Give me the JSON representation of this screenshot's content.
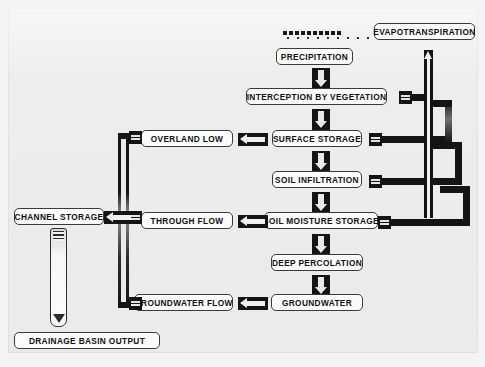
{
  "diagram": {
    "background_color": "#ededed",
    "box_fill": "#fbfbfb",
    "line_color": "#141414",
    "nodes": {
      "precipitation": "PRECIPITATION",
      "interception": "INTERCEPTION BY VEGETATION",
      "surface_storage": "SURFACE STORAGE",
      "soil_infiltration": "SOIL INFILTRATION",
      "soil_moisture_storage": "SOIL MOISTURE STORAGE",
      "deep_percolation": "DEEP PERCOLATION",
      "groundwater": "GROUNDWATER",
      "overland_flow": "OVERLAND LOW",
      "through_flow": "THROUGH FLOW",
      "groundwater_flow": "GROUNDWATER FLOW",
      "channel_storage": "CHANNEL STORAGE",
      "drainage_basin_output": "DRAINAGE BASIN OUTPUT",
      "evapotranspiration": "EVAPOTRANSPIRATION"
    },
    "icons": {
      "rain": "rain-icon",
      "down_arrow": "arrow-down-icon",
      "left_arrow": "arrow-left-icon",
      "up_arrow": "arrow-up-icon",
      "pipe": "pipe-icon",
      "outlet_tube": "outlet-tube-icon"
    },
    "flows": {
      "vertical_chain": [
        "PRECIPITATION",
        "INTERCEPTION BY VEGETATION",
        "SURFACE STORAGE",
        "SOIL INFILTRATION",
        "SOIL MOISTURE STORAGE",
        "DEEP PERCOLATION",
        "GROUNDWATER"
      ],
      "lateral_outputs": [
        {
          "from": "SURFACE STORAGE",
          "to": "OVERLAND LOW"
        },
        {
          "from": "SOIL MOISTURE STORAGE",
          "to": "THROUGH FLOW"
        },
        {
          "from": "GROUNDWATER",
          "to": "GROUNDWATER FLOW"
        }
      ],
      "to_channel_storage": [
        "OVERLAND LOW",
        "THROUGH FLOW",
        "GROUNDWATER FLOW"
      ],
      "to_evapotranspiration": [
        "INTERCEPTION BY VEGETATION",
        "SURFACE STORAGE",
        "SOIL INFILTRATION",
        "SOIL MOISTURE STORAGE"
      ],
      "basin_outlet": {
        "from": "CHANNEL STORAGE",
        "to": "DRAINAGE BASIN OUTPUT"
      }
    }
  }
}
